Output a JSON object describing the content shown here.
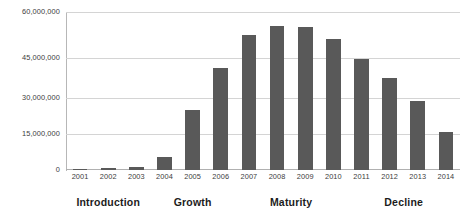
{
  "chart_data": {
    "type": "bar",
    "title": "",
    "xlabel": "",
    "ylabel": "",
    "categories": [
      "2001",
      "2002",
      "2003",
      "2004",
      "2005",
      "2006",
      "2007",
      "2008",
      "2009",
      "2010",
      "2011",
      "2012",
      "2013",
      "2014"
    ],
    "values": [
      300000,
      600000,
      1100000,
      5000000,
      23000000,
      39000000,
      51500000,
      55000000,
      54500000,
      50000000,
      42500000,
      35000000,
      26500000,
      14700000
    ],
    "ylim": [
      0,
      60000000
    ],
    "ytick_values": [
      0,
      15000000,
      30000000,
      45000000,
      60000000
    ],
    "ytick_labels": [
      "0",
      "15,000,000",
      "30,000,000",
      "45,000,000",
      "60,000,000"
    ],
    "grid": true,
    "legend": "none",
    "bar_color": "#595959",
    "gridline_color": "#d4d4d4",
    "axis_color": "#b7b7b7",
    "annotations": [
      {
        "label": "Introduction",
        "span_categories": [
          "2001",
          "2002",
          "2003"
        ]
      },
      {
        "label": "Growth",
        "span_categories": [
          "2004",
          "2005",
          "2006"
        ]
      },
      {
        "label": "Maturity",
        "span_categories": [
          "2007",
          "2008",
          "2009",
          "2010"
        ]
      },
      {
        "label": "Decline",
        "span_categories": [
          "2011",
          "2012",
          "2013",
          "2014"
        ]
      }
    ]
  },
  "stages": [
    {
      "label": "Introduction"
    },
    {
      "label": "Growth"
    },
    {
      "label": "Maturity"
    },
    {
      "label": "Decline"
    }
  ]
}
